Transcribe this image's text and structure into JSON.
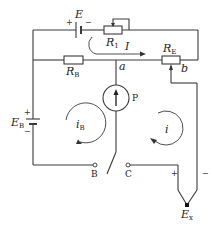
{
  "diagram": {
    "type": "potentiometer-circuit",
    "components": {
      "battery_E": {
        "label": "E",
        "plus": "+",
        "minus": "−"
      },
      "rheostat_R1": {
        "label": "R",
        "sub": "1"
      },
      "resistor_RB": {
        "label": "R",
        "sub": "B"
      },
      "resistor_RE": {
        "label": "R",
        "sub": "E"
      },
      "battery_EB": {
        "label": "E",
        "sub": "B",
        "plus": "+",
        "minus": "−"
      },
      "galvanometer": {
        "label": "P"
      },
      "unknown_emf": {
        "label": "E",
        "sub": "x",
        "plus": "+",
        "minus": "−"
      }
    },
    "nodes": {
      "a": "a",
      "b": "b",
      "terminal_B": "B",
      "terminal_C": "C"
    },
    "currents": {
      "main": "I",
      "loop_B": {
        "label": "i",
        "sub": "B"
      },
      "loop_x": "i"
    }
  }
}
